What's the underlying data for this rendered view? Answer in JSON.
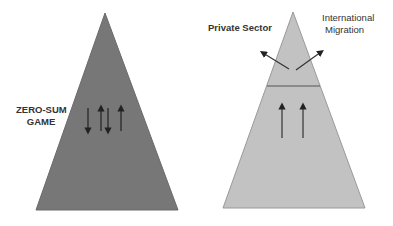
{
  "diagram": {
    "left_pyramid": {
      "label_line1": "ZERO-SUM",
      "label_line2": "GAME",
      "fill_color": "#777777",
      "arrows": [
        "down",
        "up",
        "down",
        "up"
      ]
    },
    "right_pyramid": {
      "fill_color": "#c2c2c2",
      "divider_color": "#555555",
      "arrows": [
        "up",
        "up"
      ],
      "outflows": [
        {
          "label": "Private Sector",
          "direction": "up-left"
        },
        {
          "label_line1": "International",
          "label_line2": "Migration",
          "direction": "up-right"
        }
      ]
    }
  }
}
